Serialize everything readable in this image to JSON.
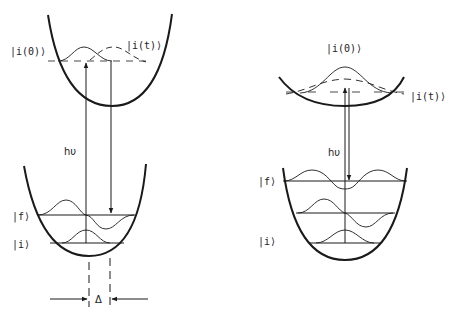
{
  "figure": {
    "type": "energy-level-diagram",
    "colors": {
      "stroke": "#1a1a1a",
      "background": "#ffffff"
    },
    "left_panel": {
      "upper_state_labels": {
        "initial": "|i(0)⟩",
        "time_evolved": "|i(t)⟩"
      },
      "lower_state_labels": {
        "final": "|f⟩",
        "initial": "|i⟩"
      },
      "photon_label": "hυ",
      "displacement_label": "Δ"
    },
    "right_panel": {
      "upper_state_labels": {
        "initial": "|i(0)⟩",
        "time_evolved": "|i(t)⟩"
      },
      "lower_state_labels": {
        "final": "|f⟩",
        "initial": "|i⟩"
      },
      "photon_label": "hυ"
    }
  }
}
